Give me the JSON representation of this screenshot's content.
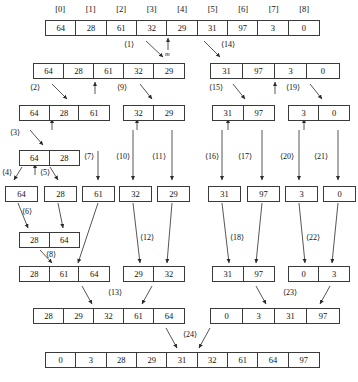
{
  "diagram": {
    "mid_marker_label": "m",
    "index_header": {
      "labels": [
        "[0]",
        "[1]",
        "[2]",
        "[3]",
        "[4]",
        "[5]",
        "[6]",
        "[7]",
        "[8]"
      ]
    },
    "step_labels": [
      "⟨1⟩",
      "⟨2⟩",
      "⟨3⟩",
      "⟨4⟩",
      "⟨5⟩",
      "⟨6⟩",
      "⟨7⟩",
      "⟨8⟩",
      "⟨9⟩",
      "⟨10⟩",
      "⟨11⟩",
      "⟨12⟩",
      "⟨13⟩",
      "⟨14⟩",
      "⟨15⟩",
      "⟨16⟩",
      "⟨17⟩",
      "⟨18⟩",
      "⟨19⟩",
      "⟨20⟩",
      "⟨21⟩",
      "⟨22⟩",
      "⟨23⟩",
      "⟨24⟩"
    ],
    "rows": [
      {
        "name": "row-initial",
        "arrays": [
          {
            "name": "array-initial-full",
            "values": [
              "64",
              "28",
              "61",
              "32",
              "29",
              "31",
              "97",
              "3",
              "0"
            ]
          }
        ]
      },
      {
        "name": "row-level-1",
        "arrays": [
          {
            "name": "array-left-5",
            "values": [
              "64",
              "28",
              "61",
              "32",
              "29"
            ]
          },
          {
            "name": "array-right-4",
            "values": [
              "31",
              "97",
              "3",
              "0"
            ]
          }
        ]
      },
      {
        "name": "row-level-2",
        "arrays": [
          {
            "name": "array-left-3",
            "values": [
              "64",
              "28",
              "61"
            ]
          },
          {
            "name": "array-left-2",
            "values": [
              "32",
              "29"
            ]
          },
          {
            "name": "array-right-left-2",
            "values": [
              "31",
              "97"
            ]
          },
          {
            "name": "array-right-right-2",
            "values": [
              "3",
              "0"
            ]
          }
        ]
      },
      {
        "name": "row-level-3",
        "arrays": [
          {
            "name": "array-pair-64-28",
            "values": [
              "64",
              "28"
            ]
          }
        ]
      },
      {
        "name": "row-singletons",
        "arrays": [
          {
            "name": "single-64",
            "values": [
              "64"
            ]
          },
          {
            "name": "single-28",
            "values": [
              "28"
            ]
          },
          {
            "name": "single-61",
            "values": [
              "61"
            ]
          },
          {
            "name": "single-32",
            "values": [
              "32"
            ]
          },
          {
            "name": "single-29",
            "values": [
              "29"
            ]
          },
          {
            "name": "single-31",
            "values": [
              "31"
            ]
          },
          {
            "name": "single-97",
            "values": [
              "97"
            ]
          },
          {
            "name": "single-3",
            "values": [
              "3"
            ]
          },
          {
            "name": "single-0",
            "values": [
              "0"
            ]
          }
        ]
      },
      {
        "name": "row-merge-1",
        "arrays": [
          {
            "name": "merged-28-64",
            "values": [
              "28",
              "64"
            ]
          }
        ]
      },
      {
        "name": "row-merge-2",
        "arrays": [
          {
            "name": "merged-28-61-64",
            "values": [
              "28",
              "61",
              "64"
            ]
          },
          {
            "name": "merged-29-32",
            "values": [
              "29",
              "32"
            ]
          },
          {
            "name": "merged-31-97",
            "values": [
              "31",
              "97"
            ]
          },
          {
            "name": "merged-0-3",
            "values": [
              "0",
              "3"
            ]
          }
        ]
      },
      {
        "name": "row-merge-3",
        "arrays": [
          {
            "name": "merged-left-5",
            "values": [
              "28",
              "29",
              "32",
              "61",
              "64"
            ]
          },
          {
            "name": "merged-right-4",
            "values": [
              "0",
              "3",
              "31",
              "97"
            ]
          }
        ]
      },
      {
        "name": "row-final",
        "arrays": [
          {
            "name": "array-final-sorted",
            "values": [
              "0",
              "3",
              "28",
              "29",
              "31",
              "32",
              "61",
              "64",
              "97"
            ]
          }
        ]
      }
    ]
  }
}
